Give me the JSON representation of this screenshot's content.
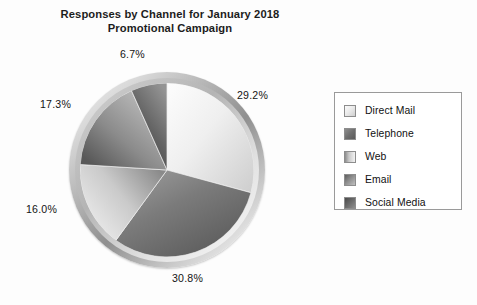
{
  "title": {
    "line1": "Responses by Channel for January 2018",
    "line2": "Promotional Campaign"
  },
  "legend": {
    "items": [
      {
        "label": "Direct Mail",
        "swatch": "direct-mail-swatch",
        "color": "#ececec"
      },
      {
        "label": "Telephone",
        "swatch": "telephone-swatch",
        "color": "#6f6f6f"
      },
      {
        "label": "Web",
        "swatch": "web-swatch",
        "color": "#c9c9c9"
      },
      {
        "label": "Email",
        "swatch": "email-swatch",
        "color": "#8d8d8d"
      },
      {
        "label": "Social Media",
        "swatch": "social-media-swatch",
        "color": "#6b6b6b"
      }
    ]
  },
  "labels": {
    "direct_mail": "29.2%",
    "telephone": "30.8%",
    "web": "16.0%",
    "email": "17.3%",
    "social_media": "6.7%"
  },
  "chart_data": {
    "type": "pie",
    "title": "Responses by Channel for January 2018 Promotional Campaign",
    "xlabel": "",
    "ylabel": "",
    "legend_position": "right",
    "start_angle_deg": 90,
    "direction": "clockwise",
    "categories": [
      "Direct Mail",
      "Telephone",
      "Web",
      "Email",
      "Social Media"
    ],
    "values": [
      29.2,
      30.8,
      16.0,
      17.3,
      6.7
    ],
    "value_unit": "percent",
    "data_labels": [
      "29.2%",
      "30.8%",
      "16.0%",
      "17.3%",
      "6.7%"
    ],
    "colors": [
      "#ececec",
      "#6f6f6f",
      "#c9c9c9",
      "#8d8d8d",
      "#6b6b6b"
    ],
    "slices": [
      {
        "name": "Direct Mail",
        "value": 29.2,
        "label": "29.2%",
        "start_deg": 0.0,
        "end_deg": 105.12
      },
      {
        "name": "Telephone",
        "value": 30.8,
        "label": "30.8%",
        "start_deg": 105.12,
        "end_deg": 216.0
      },
      {
        "name": "Web",
        "value": 16.0,
        "label": "16.0%",
        "start_deg": 216.0,
        "end_deg": 273.6
      },
      {
        "name": "Email",
        "value": 17.3,
        "label": "17.3%",
        "start_deg": 273.6,
        "end_deg": 335.88
      },
      {
        "name": "Social Media",
        "value": 6.7,
        "label": "6.7%",
        "start_deg": 335.88,
        "end_deg": 360.0
      }
    ],
    "total": 100.0,
    "grid": false,
    "style": "3d-beveled-grayscale"
  }
}
